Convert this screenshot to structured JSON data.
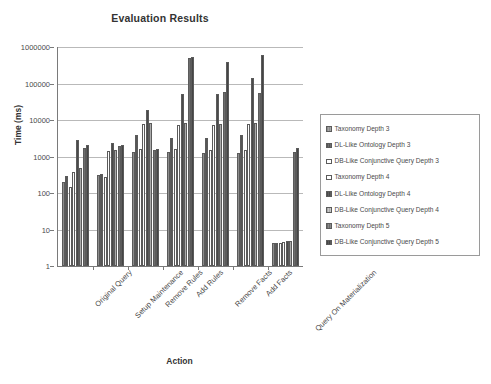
{
  "chart_data": {
    "type": "bar",
    "title": "Evaluation Results",
    "xlabel": "Action",
    "ylabel": "Time (ms)",
    "yscale": "log",
    "ylim": [
      1,
      1000000
    ],
    "ytick_labels": [
      "1000000",
      "100000",
      "10000",
      "1000",
      "100",
      "10",
      "1"
    ],
    "ytick_values": [
      1000000,
      100000,
      10000,
      1000,
      100,
      10,
      1
    ],
    "grid": true,
    "legend_position": "right",
    "categories": [
      "Original Query",
      "Setup Maintenance",
      "Remove Rules",
      "Add Rules",
      "Remove Facts",
      "Add Facts",
      "Query On Materialization"
    ],
    "series": [
      {
        "name": "Taxonomy Depth 3",
        "color": "#a6a6a6",
        "values": [
          200,
          310,
          1350,
          1350,
          1280,
          1280,
          4.3
        ]
      },
      {
        "name": "DL-Like Ontology Depth 3",
        "color": "#6e6e6e",
        "values": [
          290,
          330,
          4000,
          3200,
          3200,
          3800,
          4.3
        ]
      },
      {
        "name": "DB-Like Conjunctive Query Depth 3",
        "color": "#ffffff",
        "values": [
          150,
          270,
          1600,
          1600,
          1500,
          1500,
          4.3
        ]
      },
      {
        "name": "Taxonomy Depth 4",
        "color": "#ffffff",
        "values": [
          380,
          1400,
          7800,
          7500,
          7400,
          7700,
          4.6
        ]
      },
      {
        "name": "DL-Like Ontology Depth 4",
        "color": "#5e5e5e",
        "values": [
          2800,
          2300,
          19000,
          52000,
          53000,
          140000,
          5.0
        ]
      },
      {
        "name": "DB-Like Conjunctive Query Depth 4",
        "color": "#c9c9c9",
        "values": [
          480,
          1500,
          8200,
          8100,
          8000,
          8100,
          5.0
        ]
      },
      {
        "name": "Taxonomy Depth 5",
        "color": "#8a8a8a",
        "values": [
          1700,
          2000,
          1550,
          500000,
          57000,
          56000,
          1300
        ]
      },
      {
        "name": "DB-Like Conjunctive Query Depth 5",
        "color": "#5a5a5a",
        "values": [
          2050,
          2100,
          1600,
          520000,
          400000,
          600000,
          1700
        ]
      }
    ]
  },
  "legend": {
    "items": [
      "Taxonomy Depth 3",
      "DL-Like Ontology Depth 3",
      "DB-Like Conjunctive Query Depth 3",
      "Taxonomy Depth 4",
      "DL-Like Ontology Depth 4",
      "DB-Like Conjunctive Query Depth 4",
      "Taxonomy Depth 5",
      "DB-Like Conjunctive Query Depth 5"
    ]
  }
}
